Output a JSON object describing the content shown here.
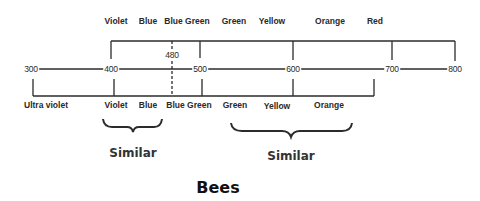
{
  "title": "Bees",
  "top_labels": [
    {
      "text": "Violet",
      "x": 116
    },
    {
      "text": "Blue",
      "x": 148
    },
    {
      "text": "Blue Green",
      "x": 187
    },
    {
      "text": "Green",
      "x": 234
    },
    {
      "text": "Yellow",
      "x": 272
    },
    {
      "text": "Orange",
      "x": 330
    },
    {
      "text": "Red",
      "x": 375
    }
  ],
  "scale": {
    "ticks": [
      {
        "value": "300",
        "x": 31
      },
      {
        "value": "400",
        "x": 111
      },
      {
        "value": "500",
        "x": 200
      },
      {
        "value": "600",
        "x": 293
      },
      {
        "value": "700",
        "x": 392
      },
      {
        "value": "800",
        "x": 455
      }
    ],
    "marker": {
      "value": "480",
      "x": 172
    }
  },
  "bottom_labels": [
    {
      "text": "Ultra violet",
      "x": 46
    },
    {
      "text": "Violet",
      "x": 116
    },
    {
      "text": "Blue",
      "x": 148
    },
    {
      "text": "Blue Green",
      "x": 189
    },
    {
      "text": "Green",
      "x": 235
    },
    {
      "text": "Yellow",
      "x": 277
    },
    {
      "text": "Orange",
      "x": 329
    }
  ],
  "groups": [
    {
      "label": "Similar",
      "x": 133
    },
    {
      "label": "Similar",
      "x": 291
    }
  ],
  "colors": {
    "line": "#2b2b2b",
    "text": "#2a2a2a"
  }
}
